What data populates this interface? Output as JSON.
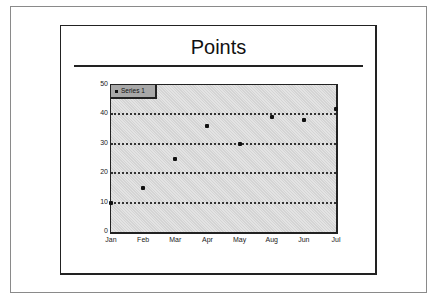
{
  "chart_data": {
    "type": "scatter",
    "title": "Points",
    "xlabel": "",
    "ylabel": "",
    "categories": [
      "Jan",
      "Feb",
      "Mar",
      "Apr",
      "May",
      "Aug",
      "Jun",
      "Jul"
    ],
    "series": [
      {
        "name": "Series 1",
        "values": [
          10,
          15,
          25,
          36,
          30,
          39,
          38,
          42
        ]
      }
    ],
    "yticks": [
      "0",
      "10",
      "20",
      "30",
      "40",
      "50"
    ],
    "ylim": [
      0,
      50
    ],
    "grid": {
      "horizontal": true,
      "style": "dotted",
      "lines_at": [
        10,
        20,
        30,
        40
      ]
    },
    "legend": {
      "position": "top-left-inside",
      "entries": [
        "Series 1"
      ]
    }
  },
  "colors": {
    "plot_background": "#d4d4d4",
    "legend_background": "#a8a8a8",
    "marker": "#111111"
  }
}
